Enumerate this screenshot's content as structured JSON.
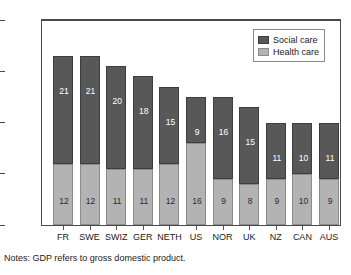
{
  "chart_data": {
    "type": "bar",
    "subtype": "stacked-vertical",
    "title": "",
    "xlabel": "",
    "ylabel": "",
    "ylim": [
      0,
      40
    ],
    "ytick_labels": [
      "0%",
      "10%",
      "20%",
      "30%",
      "40%"
    ],
    "ytick_values": [
      0,
      10,
      20,
      30,
      40
    ],
    "grid": false,
    "legend_position": "top-right",
    "categories": [
      "FR",
      "SWE",
      "SWIZ",
      "GER",
      "NETH",
      "US",
      "NOR",
      "UK",
      "NZ",
      "CAN",
      "AUS"
    ],
    "series": [
      {
        "name": "Health care",
        "color": "#b3b3b3",
        "values": [
          12,
          12,
          11,
          11,
          12,
          16,
          9,
          8,
          9,
          10,
          9
        ]
      },
      {
        "name": "Social care",
        "color": "#585858",
        "values": [
          21,
          21,
          20,
          18,
          15,
          9,
          16,
          15,
          11,
          10,
          11
        ]
      }
    ],
    "totals": [
      33,
      33,
      31,
      29,
      27,
      25,
      25,
      23,
      20,
      20,
      20
    ]
  },
  "legend": {
    "entries": [
      {
        "label": "Social care",
        "swatch": "social"
      },
      {
        "label": "Health care",
        "swatch": "health"
      }
    ]
  },
  "note": {
    "text": "Notes: GDP refers to gross domestic product."
  }
}
